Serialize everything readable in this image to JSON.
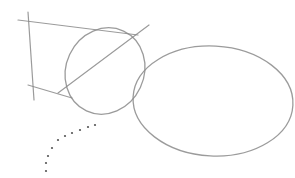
{
  "image": {
    "description": "Pencil sketch on white paper",
    "background": "#ffffff",
    "stroke_color": "#8a8a8a",
    "dot_color": "#555555"
  },
  "sketch": {
    "lines": [
      {
        "name": "top-construction-line",
        "x1": 18,
        "y1": 20,
        "x2": 138,
        "y2": 35
      },
      {
        "name": "vertical-construction-line",
        "x1": 28,
        "y1": 12,
        "x2": 34,
        "y2": 100
      },
      {
        "name": "bottom-construction-line",
        "x1": 28,
        "y1": 85,
        "x2": 72,
        "y2": 98
      },
      {
        "name": "diagonal-construction-line",
        "x1": 58,
        "y1": 93,
        "x2": 149,
        "y2": 25
      }
    ],
    "ellipses": [
      {
        "name": "small-tilted-ellipse",
        "cx": 105,
        "cy": 71,
        "rx": 39,
        "ry": 44,
        "rotate": 25
      },
      {
        "name": "large-ellipse",
        "cx": 213,
        "cy": 101,
        "rx": 80,
        "ry": 55,
        "rotate": 3
      }
    ],
    "dots": [
      {
        "x": 95,
        "y": 125
      },
      {
        "x": 88,
        "y": 127
      },
      {
        "x": 80,
        "y": 130
      },
      {
        "x": 72,
        "y": 133
      },
      {
        "x": 65,
        "y": 136
      },
      {
        "x": 58,
        "y": 140
      },
      {
        "x": 52,
        "y": 148
      },
      {
        "x": 48,
        "y": 156
      },
      {
        "x": 46,
        "y": 163
      },
      {
        "x": 46,
        "y": 171
      }
    ]
  }
}
